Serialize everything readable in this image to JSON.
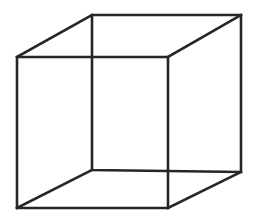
{
  "figure": {
    "name": "necker-cube",
    "type": "line-drawing",
    "caption": "",
    "canvas": {
      "width": 254,
      "height": 224,
      "background_color": "#ffffff"
    },
    "style": {
      "stroke_color": "#262626",
      "stroke_width": 2.6,
      "fill": "none",
      "line_cap": "square",
      "line_join": "miter"
    },
    "vertices": {
      "front_top_left": [
        17,
        57
      ],
      "front_top_right": [
        168,
        57
      ],
      "front_bottom_right": [
        168,
        208
      ],
      "front_bottom_left": [
        17,
        208
      ],
      "back_top_left": [
        92,
        15
      ],
      "back_top_right": [
        241,
        15
      ],
      "back_bottom_right": [
        241,
        172
      ],
      "back_bottom_left": [
        92,
        170
      ]
    },
    "edges": [
      {
        "name": "front-face",
        "label": "Front square face",
        "points": "17,57 168,57 168,208 17,208 17,57"
      },
      {
        "name": "back-face",
        "label": "Back square face",
        "points": "92,15 241,15 241,172 92,170 92,15"
      },
      {
        "name": "connector-top-left",
        "label": "Top-left depth edge",
        "points": "17,57 92,15"
      },
      {
        "name": "connector-top-right",
        "label": "Top-right depth edge",
        "points": "168,57 241,15"
      },
      {
        "name": "connector-bottom-right",
        "label": "Bottom-right depth edge",
        "points": "168,208 241,172"
      },
      {
        "name": "connector-bottom-left",
        "label": "Bottom-left depth edge",
        "points": "17,208 92,170"
      }
    ]
  }
}
